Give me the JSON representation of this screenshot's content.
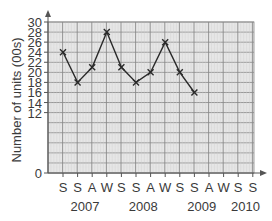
{
  "chart_data": {
    "type": "line",
    "title": "",
    "xlabel": "",
    "ylabel": "Number of units (00s)",
    "ylim": [
      0,
      30
    ],
    "yticks": [
      0,
      12,
      14,
      16,
      18,
      20,
      22,
      24,
      26,
      28,
      30
    ],
    "x_tick_labels": [
      "S",
      "S",
      "A",
      "W",
      "S",
      "S",
      "A",
      "W",
      "S",
      "S",
      "A",
      "W",
      "S",
      "S"
    ],
    "year_labels": [
      {
        "label": "2007",
        "center_index": 1.5
      },
      {
        "label": "2008",
        "center_index": 5.5
      },
      {
        "label": "2009",
        "center_index": 9.5
      },
      {
        "label": "2010",
        "center_index": 12.5
      }
    ],
    "categories": [
      "S 2007",
      "S 2007",
      "A 2007",
      "W 2007",
      "S 2008",
      "S 2008",
      "A 2008",
      "W 2008",
      "S 2009",
      "S 2009"
    ],
    "series": [
      {
        "name": "Number of units (00s)",
        "marker": "x",
        "values": [
          24,
          18,
          21,
          28,
          21,
          18,
          20,
          26,
          20,
          16
        ]
      }
    ],
    "grid": true,
    "legend": null
  },
  "colors": {
    "line": "#2a2a2a",
    "grid_major": "#8a8a8a",
    "grid_minor": "#cfcfcf",
    "text": "#3a3a3a"
  }
}
